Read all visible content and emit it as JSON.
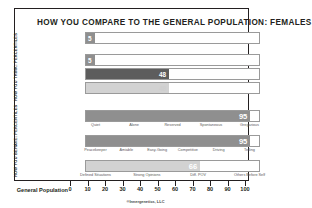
{
  "title": "HOW YOU COMPARE TO THE GENERAL POPULATION: FEMALES",
  "side_labels": {
    "think": "HOW YOU THINK: PERCENTILES",
    "behave": "HOW YOU BEHAVE: PERCENTILES"
  },
  "axis": {
    "label": "General Population",
    "ticks": [
      0,
      10,
      20,
      30,
      40,
      50,
      60,
      70,
      80,
      90,
      100
    ]
  },
  "footer": "®Innergenetics, LLC",
  "colors": {
    "dark": "#5d5d5d",
    "mid": "#8f8f8f",
    "light": "#d2d2d2",
    "border": "#9a9a9a",
    "text": "#231f20"
  },
  "chart_data": {
    "type": "bar",
    "title": "HOW YOU COMPARE TO THE GENERAL POPULATION: FEMALES",
    "xlabel": "General Population",
    "ylabel": "",
    "xlim": [
      0,
      100
    ],
    "grid": false,
    "orientation": "horizontal",
    "categories": [
      "Analytical",
      "Structural",
      "Social",
      "Conceptual",
      "Expressiveness",
      "Assertiveness",
      "Flexibility"
    ],
    "values": [
      5,
      5,
      48,
      48,
      95,
      95,
      66
    ],
    "groups": [
      {
        "name": "HOW YOU THINK: PERCENTILES",
        "bars": [
          {
            "label": "Analytical",
            "value": 5,
            "shade": "mid",
            "value_on": "dark"
          },
          {
            "label": "Structural",
            "value": 5,
            "shade": "mid",
            "value_on": "dark"
          },
          {
            "label": "Social",
            "value": 48,
            "shade": "dark",
            "value_on": "dark"
          },
          {
            "label": "Conceptual",
            "value": 48,
            "shade": "light",
            "value_on": "light"
          }
        ]
      },
      {
        "name": "HOW YOU BEHAVE: PERCENTILES",
        "bars": [
          {
            "label": "Expressiveness",
            "value": 95,
            "shade": "mid",
            "value_on": "dark",
            "scale": [
              "Quiet",
              "Alone",
              "Reserved",
              "Spontaneous",
              "Gregarious"
            ]
          },
          {
            "label": "Assertiveness",
            "value": 95,
            "shade": "mid",
            "value_on": "dark",
            "scale": [
              "Peacekeeper",
              "Amiable",
              "Easy-Going",
              "Competitive",
              "Driving",
              "Telling"
            ]
          },
          {
            "label": "Flexibility",
            "value": 66,
            "shade": "light",
            "value_on": "dark",
            "scale": [
              "Defined Situations",
              "Strong Opinions",
              "Diff. POV",
              "Others Before Self"
            ]
          }
        ]
      }
    ]
  },
  "rows": [
    {
      "label": "Analytical",
      "value": 5,
      "value_text": "5"
    },
    {
      "label": "Structural",
      "value": 5,
      "value_text": "5"
    },
    {
      "label": "Social",
      "value": 48,
      "value_text": "48"
    },
    {
      "label": "Conceptual",
      "value": 48,
      "value_text": "48"
    },
    {
      "label": "Expressiveness",
      "value": 95,
      "value_text": "95"
    },
    {
      "label": "Assertiveness",
      "value": 95,
      "value_text": "95"
    },
    {
      "label": "Flexibility",
      "value": 66,
      "value_text": "66"
    }
  ],
  "scales": {
    "expressiveness": [
      "Quiet",
      "Alone",
      "Reserved",
      "Spontaneous",
      "Gregarious"
    ],
    "assertiveness": [
      "Peacekeeper",
      "Amiable",
      "Easy-Going",
      "Competitive",
      "Driving",
      "Telling"
    ],
    "flexibility": [
      "Defined Situations",
      "Strong Opinions",
      "Diff. POV",
      "Others Before Self"
    ]
  }
}
